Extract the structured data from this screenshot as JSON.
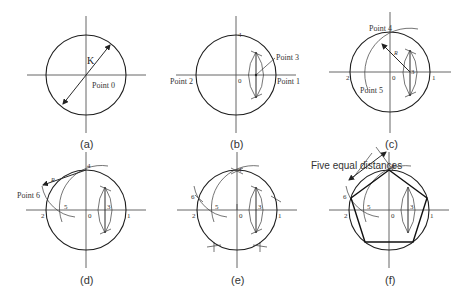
{
  "figure": {
    "colors": {
      "line": "#2a2a2a",
      "text": "#333333",
      "background": "#ffffff"
    },
    "panels": [
      {
        "id": "a",
        "caption": "(a)",
        "labels": {
          "radius": "K",
          "center": "Point 0"
        }
      },
      {
        "id": "b",
        "caption": "(b)",
        "labels": {
          "p4": "4",
          "p3": "Point 3",
          "p2": "Point 2",
          "p0": "0",
          "p1": "Point 1"
        }
      },
      {
        "id": "c",
        "caption": "(c)",
        "labels": {
          "p4": "Point 4",
          "r": "R",
          "p3": "3",
          "p2": "2",
          "p0": "0",
          "p1": "1",
          "p5": "Point 5"
        }
      },
      {
        "id": "d",
        "caption": "(d)",
        "labels": {
          "p4": "4",
          "r": "R",
          "p6": "Point 6",
          "p2": "2",
          "p5": "5",
          "p0": "0",
          "p3": "3",
          "p1": "1"
        }
      },
      {
        "id": "e",
        "caption": "(e)",
        "labels": {
          "p4": "4",
          "p6": "6",
          "p2": "2",
          "p5": "5",
          "p0": "0",
          "p3": "3",
          "p1": "1"
        }
      },
      {
        "id": "f",
        "caption": "(f)",
        "annotation": "Five equal distances",
        "labels": {
          "p4": "4",
          "p6": "6",
          "p2": "2",
          "p5": "5",
          "p0": "0",
          "p3": "3",
          "p1": "1"
        }
      }
    ]
  }
}
